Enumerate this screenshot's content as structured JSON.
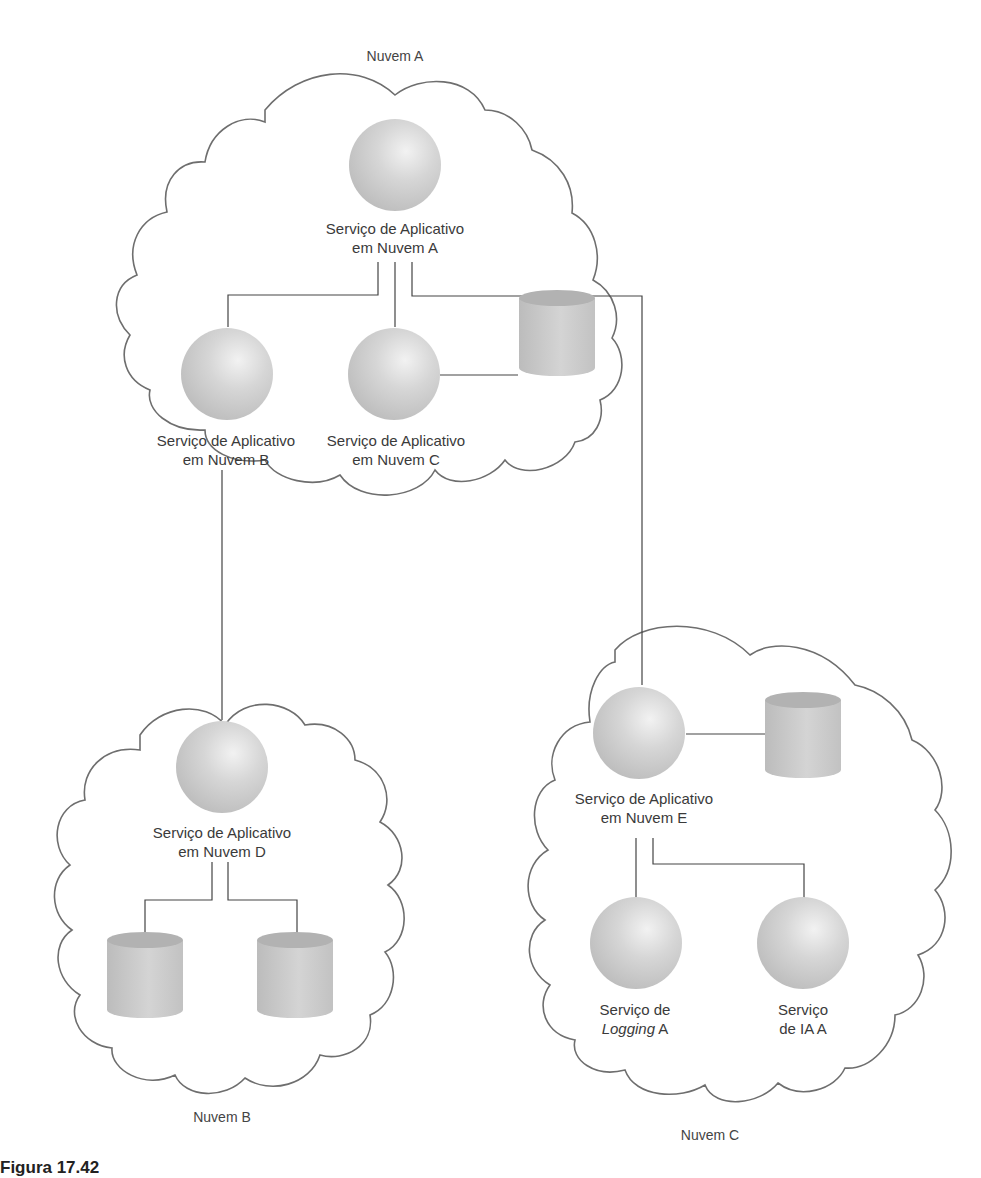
{
  "clouds": {
    "a": {
      "title": "Nuvem A"
    },
    "b": {
      "title": "Nuvem B"
    },
    "c": {
      "title": "Nuvem C"
    }
  },
  "services": {
    "app_a": {
      "line1": "Serviço de Aplicativo",
      "line2": "em Nuvem A"
    },
    "app_b": {
      "line1": "Serviço de Aplicativo",
      "line2": "em Nuvem B"
    },
    "app_c": {
      "line1": "Serviço de Aplicativo",
      "line2": "em Nuvem C"
    },
    "app_d": {
      "line1": "Serviço de Aplicativo",
      "line2": "em Nuvem D"
    },
    "app_e": {
      "line1": "Serviço de Aplicativo",
      "line2": "em Nuvem E"
    },
    "logging": {
      "line1": "Serviço de",
      "line2_italic": "Logging",
      "line2_rest": " A"
    },
    "ia": {
      "line1": "Serviço",
      "line2": "de IA A"
    }
  },
  "caption": "Figura 17.42",
  "colors": {
    "outline": "#6e6e6e",
    "connector": "#444444",
    "node_fill": "#c8c8c8",
    "node_highlight": "#ececec"
  }
}
